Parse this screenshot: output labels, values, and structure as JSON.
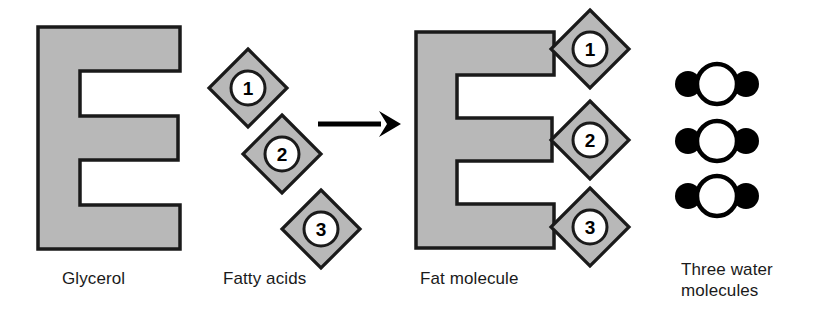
{
  "diagram": {
    "title_caption": "",
    "colors": {
      "gray_fill": "#b8b8b8",
      "outline": "#1a1a1a",
      "white": "#ffffff",
      "black": "#000000",
      "text": "#1a1a1a",
      "background": "#ffffff"
    },
    "labels": {
      "glycerol": "Glycerol",
      "fatty_acids": "Fatty acids",
      "fat_molecule": "Fat molecule",
      "water": "Three water\nmolecules"
    },
    "reactants": {
      "glycerol": {
        "name": "Glycerol",
        "shape": "E-shape"
      },
      "fatty_acids": {
        "name": "Fatty acids",
        "shape": "diamond",
        "items": [
          {
            "number": "1"
          },
          {
            "number": "2"
          },
          {
            "number": "3"
          }
        ]
      }
    },
    "reaction_arrow": {
      "direction": "right",
      "icon": "arrow-right-icon"
    },
    "products": {
      "fat_molecule": {
        "name": "Fat molecule",
        "shape": "E-shape",
        "attached_fatty_acids": [
          {
            "number": "1"
          },
          {
            "number": "2"
          },
          {
            "number": "3"
          }
        ]
      },
      "water": {
        "name": "Three water\nmolecules",
        "count": 3,
        "atoms": {
          "oxygen": "O",
          "hydrogen": "H"
        }
      }
    }
  }
}
